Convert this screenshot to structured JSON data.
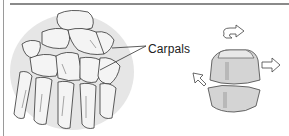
{
  "figure": {
    "labels": {
      "carpals": "Carpals"
    },
    "icons": {
      "rotation_arrow": "curved-arrow-icon",
      "glide_arrow_right": "arrow-right-icon",
      "glide_arrow_left": "arrow-up-left-icon"
    },
    "colors": {
      "bone_fill": "#f2f2f2",
      "shadow_disc": "#e4e4e4",
      "block_fill": "#d6d6d6",
      "block_top": "#e6e6e6",
      "line": "#333333",
      "rule": "#8a8a8a"
    }
  }
}
